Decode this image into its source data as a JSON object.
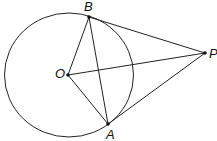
{
  "diagram": {
    "title": "",
    "circle": {
      "center_label": "O",
      "cx": 69,
      "cy": 75,
      "rx": 64.5,
      "ry": 62
    },
    "points": {
      "B": {
        "label": "B",
        "x": 89,
        "y": 17
      },
      "O": {
        "label": "O",
        "x": 68,
        "y": 75
      },
      "A": {
        "label": "A",
        "x": 108,
        "y": 124
      },
      "P": {
        "label": "P",
        "x": 205,
        "y": 53
      }
    },
    "segments": [
      "PB",
      "PA",
      "PO",
      "OB",
      "OA",
      "AB"
    ],
    "colors": {
      "stroke": "#222222",
      "point": "#111111"
    }
  }
}
